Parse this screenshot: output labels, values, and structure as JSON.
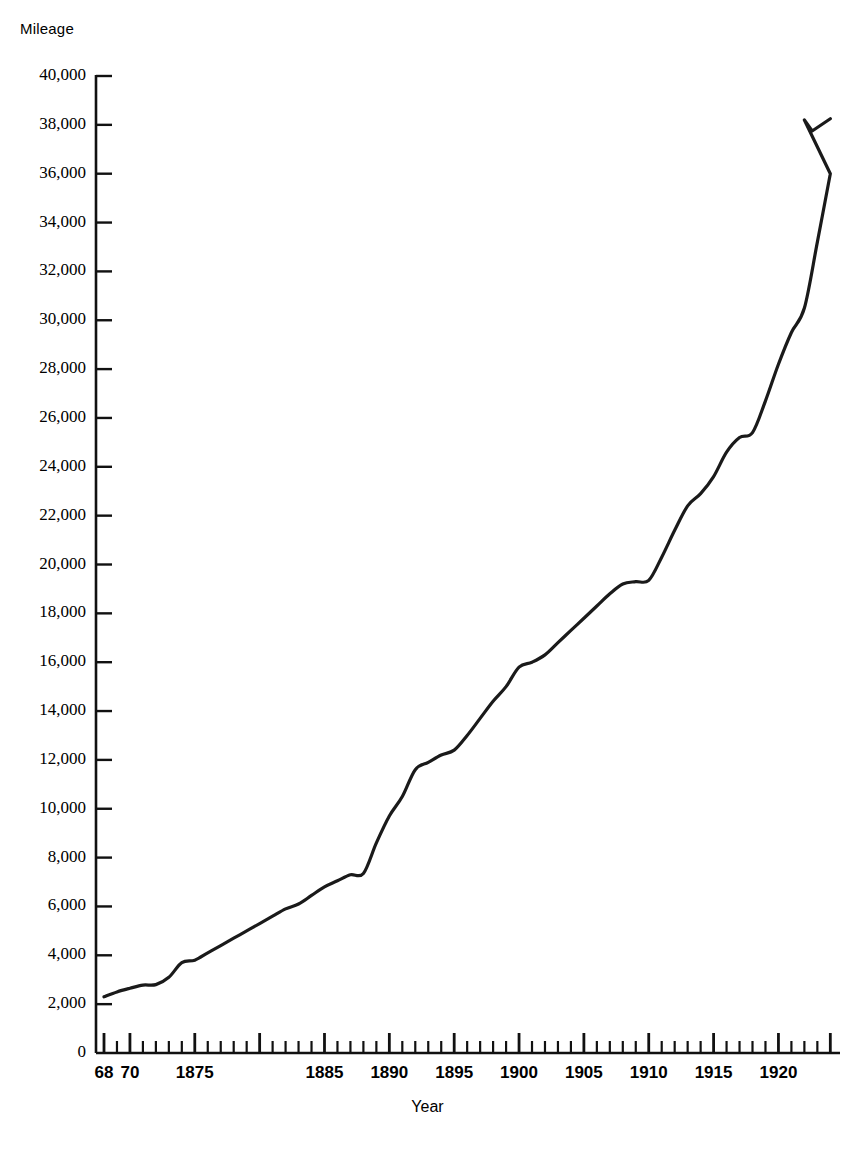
{
  "chart_data": {
    "type": "line",
    "title": "",
    "xlabel": "Year",
    "ylabel": "Mileage",
    "xlim": [
      1868,
      1924.5
    ],
    "ylim": [
      0,
      40000
    ],
    "grid": false,
    "legend": false,
    "y_ticks": [
      0,
      2000,
      4000,
      6000,
      8000,
      10000,
      12000,
      14000,
      16000,
      18000,
      20000,
      22000,
      24000,
      26000,
      28000,
      30000,
      32000,
      34000,
      36000,
      38000,
      40000
    ],
    "y_tick_labels": [
      "0",
      "2,000",
      "4,000",
      "6,000",
      "8,000",
      "10,000",
      "12,000",
      "14,000",
      "16,000",
      "18,000",
      "20,000",
      "22,000",
      "24,000",
      "26,000",
      "28,000",
      "30,000",
      "32,000",
      "34,000",
      "36,000",
      "38,000",
      "40,000"
    ],
    "x_major_ticks": [
      1868,
      1870,
      1875,
      1885,
      1890,
      1895,
      1900,
      1905,
      1910,
      1915,
      1920
    ],
    "x_major_tick_labels": [
      "68",
      "70",
      "1875",
      "1885",
      "1890",
      "1895",
      "1900",
      "1905",
      "1910",
      "1915",
      "1920"
    ],
    "x_minor_tick_interval": 1,
    "series": [
      {
        "name": "Mileage",
        "color": "#1a1a1a",
        "x": [
          1868,
          1869,
          1870,
          1871,
          1872,
          1873,
          1874,
          1875,
          1876,
          1877,
          1878,
          1879,
          1880,
          1881,
          1882,
          1883,
          1884,
          1885,
          1886,
          1887,
          1888,
          1889,
          1890,
          1891,
          1892,
          1893,
          1894,
          1895,
          1896,
          1897,
          1898,
          1899,
          1900,
          1901,
          1902,
          1903,
          1904,
          1905,
          1906,
          1907,
          1908,
          1909,
          1910,
          1911,
          1912,
          1913,
          1914,
          1915,
          1916,
          1917,
          1918,
          1919,
          1920,
          1921,
          1922,
          1923,
          1924
        ],
        "values": [
          2300,
          2500,
          2650,
          2780,
          2800,
          3100,
          3700,
          3800,
          4100,
          4400,
          4700,
          5000,
          5300,
          5600,
          5900,
          6100,
          6450,
          6800,
          7050,
          7300,
          7350,
          8600,
          9700,
          10500,
          11600,
          11900,
          12200,
          12400,
          13000,
          13700,
          14400,
          15000,
          15800,
          16000,
          16300,
          16800,
          17300,
          17800,
          18300,
          18800,
          19200,
          19300,
          19350,
          20300,
          21400,
          22400,
          22900,
          23600,
          24600,
          25200,
          25400,
          26700,
          28200,
          29500,
          30500,
          33200,
          36000
        ]
      }
    ],
    "annotations": [],
    "peak": {
      "year": 1922,
      "value": 38200
    },
    "final": {
      "year": 1924,
      "value": 38250
    }
  },
  "axis": {
    "y_axis_name": "Mileage",
    "x_axis_name": "Year"
  }
}
